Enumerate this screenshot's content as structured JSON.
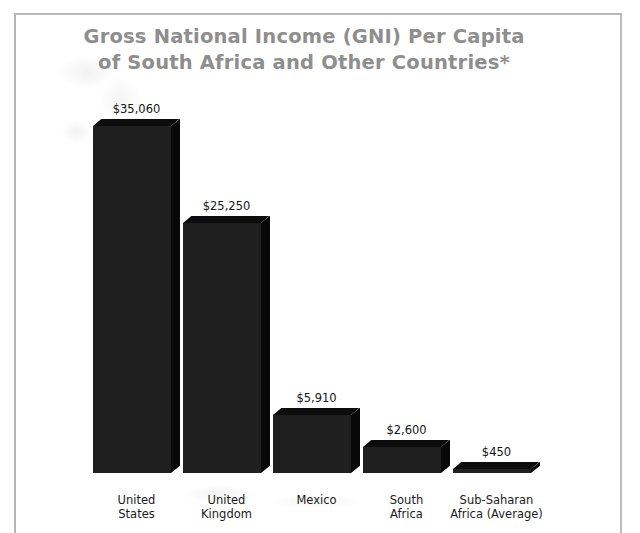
{
  "chart_data": {
    "type": "bar",
    "title": "Gross National Income (GNI) Per Capita of South Africa and Other Countries*",
    "title_lines": [
      "Gross National Income (GNI) Per Capita",
      "of South Africa and Other Countries*"
    ],
    "xlabel": "",
    "ylabel": "",
    "ylim": [
      0,
      35060
    ],
    "grid": false,
    "legend": "none",
    "currency": "USD",
    "categories": [
      "United States",
      "United Kingdom",
      "Mexico",
      "South Africa",
      "Sub-Saharan Africa (Average)"
    ],
    "category_lines": [
      [
        "United",
        "States"
      ],
      [
        "United",
        "Kingdom"
      ],
      [
        "Mexico"
      ],
      [
        "South",
        "Africa"
      ],
      [
        "Sub-Saharan",
        "Africa (Average)"
      ]
    ],
    "values": [
      35060,
      25250,
      5910,
      2600,
      450
    ],
    "value_labels": [
      "$35,060",
      "$25,250",
      "$5,910",
      "$2,600",
      "$450"
    ],
    "colors": {
      "bar_front": "#1f1f1f",
      "bar_top": "#0c0c0c",
      "bar_side": "#080808",
      "title": "#8e8e8e",
      "label_text": "#151515",
      "background": "#ffffff",
      "frame_border": "#b8b8b8"
    }
  }
}
